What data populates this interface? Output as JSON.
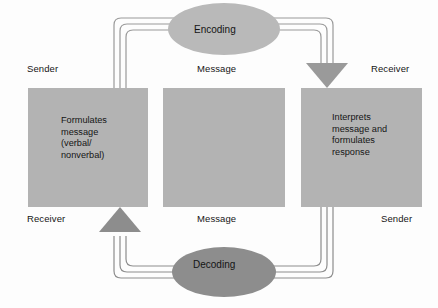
{
  "diagram": {
    "colors": {
      "box_fill": "#b3b3b3",
      "encoding_ellipse_fill": "#b9b9b9",
      "decoding_ellipse_fill": "#8d8d8d",
      "arrow_down_fill": "#9a9a9a",
      "arrow_up_fill": "#8d8d8d",
      "line_stroke": "#9a9a9a",
      "text": "#151515",
      "background": "#fdfdfd"
    },
    "labels": {
      "sender_top": "Sender",
      "message_top": "Message",
      "receiver_top": "Receiver",
      "receiver_bottom": "Receiver",
      "message_bottom": "Message",
      "sender_bottom": "Sender"
    },
    "boxes": [
      {
        "id": "left",
        "role_top": "Sender",
        "role_bottom": "Receiver",
        "text": "Formulates\nmessage\n(verbal/\nnonverbal)"
      },
      {
        "id": "middle",
        "role_top": "Message",
        "role_bottom": "Message",
        "text": ""
      },
      {
        "id": "right",
        "role_top": "Receiver",
        "role_bottom": "Sender",
        "text": "Interprets\nmessage and\nformulates\nresponse"
      }
    ],
    "ellipses": [
      {
        "id": "encoding",
        "label": "Encoding",
        "position": "top"
      },
      {
        "id": "decoding",
        "label": "Decoding",
        "position": "bottom"
      }
    ],
    "arrows": [
      {
        "id": "top-flow",
        "direction": "down",
        "from": "left-box",
        "through": "encoding",
        "to": "right-box"
      },
      {
        "id": "bottom-flow",
        "direction": "up",
        "from": "right-box",
        "through": "decoding",
        "to": "left-box"
      }
    ]
  }
}
